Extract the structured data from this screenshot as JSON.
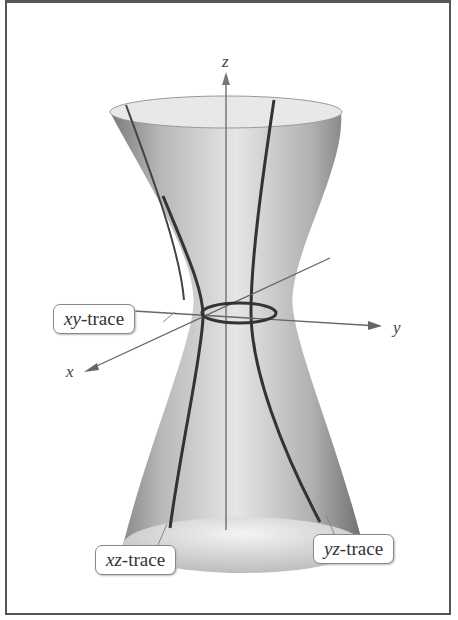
{
  "figure": {
    "axes": {
      "z": "z",
      "y": "y",
      "x": "x"
    },
    "callouts": [
      {
        "id": "xy",
        "var": "xy",
        "suffix": "-trace"
      },
      {
        "id": "xz",
        "var": "xz",
        "suffix": "-trace"
      },
      {
        "id": "yz",
        "var": "yz",
        "suffix": "-trace"
      }
    ]
  }
}
